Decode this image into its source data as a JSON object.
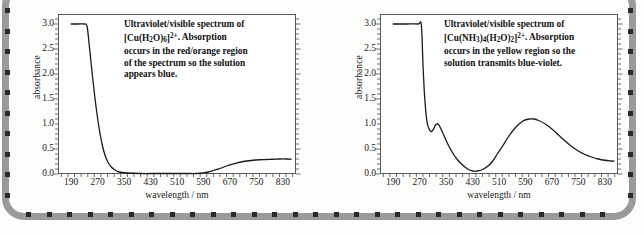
{
  "figure": {
    "background_color": "#fdfdfc",
    "border_color": "#9a9a9a",
    "dot_color": "#2a2a2a",
    "curve_color": "#1a1a1a"
  },
  "panels": [
    {
      "id": "cu-aqua",
      "annotation_plain": "Ultraviolet/visible spectrum of [Cu(H2O)6]2+. Absorption occurs in the red/orange region of the spectrum so the solution appears blue.",
      "annotation_parts": {
        "line1": "Ultraviolet/visible spectrum of",
        "formula_pre": "[Cu(H",
        "formula_sub1": "2",
        "formula_mid": "O)",
        "formula_sub2": "6",
        "formula_post": "]",
        "formula_sup": "2+",
        "after_formula": ". Absorption",
        "line3": "occurs in the red/orange region",
        "line4": "of the spectrum so the solution",
        "line5": "appears blue."
      }
    },
    {
      "id": "cu-ammine",
      "annotation_plain": "Ultraviolet/visible spectrum of [Cu(NH3)4(H2O)2]2+. Absorption occurs in the yellow region so the solution transmits blue-violet.",
      "annotation_parts": {
        "line1": "Ultraviolet/visible spectrum of",
        "formula_pre": "[Cu(NH",
        "formula_sub1": "3",
        "formula_mid": ")",
        "formula_sub2": "4",
        "formula_mid2": "(H",
        "formula_sub3": "2",
        "formula_mid3": "O)",
        "formula_sub4": "2",
        "formula_post": "]",
        "formula_sup": "2+",
        "after_formula": ". Absorption",
        "line3": "occurs in the yellow region so the",
        "line4": "solution transmits blue-violet."
      }
    }
  ],
  "chart_data": [
    {
      "type": "line",
      "title": "Ultraviolet/visible spectrum of [Cu(H2O)6]2+",
      "xlabel": "wavelength / nm",
      "ylabel": "absorbance",
      "xlim": [
        150,
        870
      ],
      "ylim": [
        0.0,
        3.2
      ],
      "xticks": [
        190,
        270,
        350,
        430,
        510,
        590,
        670,
        750,
        830
      ],
      "yticks": [
        "0.0",
        "0.5",
        "1.0",
        "1.5",
        "2.0",
        "2.5",
        "3.0"
      ],
      "ytick_values": [
        0.0,
        0.5,
        1.0,
        1.5,
        2.0,
        2.5,
        3.0
      ],
      "minor_tick_step": 20,
      "grid": false,
      "legend": "none",
      "series": [
        {
          "name": "absorbance",
          "x": [
            190,
            210,
            230,
            238,
            245,
            252,
            260,
            268,
            276,
            284,
            292,
            300,
            310,
            320,
            335,
            360,
            400,
            450,
            500,
            540,
            570,
            590,
            605,
            620,
            640,
            660,
            680,
            700,
            720,
            740,
            760,
            780,
            800,
            820,
            840,
            855
          ],
          "y": [
            3.0,
            3.0,
            3.0,
            2.95,
            2.55,
            2.1,
            1.62,
            1.2,
            0.85,
            0.58,
            0.38,
            0.25,
            0.15,
            0.09,
            0.04,
            0.02,
            0.01,
            0.01,
            0.01,
            0.01,
            0.01,
            0.02,
            0.04,
            0.07,
            0.11,
            0.16,
            0.2,
            0.235,
            0.26,
            0.275,
            0.285,
            0.29,
            0.295,
            0.3,
            0.3,
            0.295
          ]
        }
      ]
    },
    {
      "type": "line",
      "title": "Ultraviolet/visible spectrum of [Cu(NH3)4(H2O)2]2+",
      "xlabel": "wavelength / nm",
      "ylabel": "absorbance",
      "xlim": [
        150,
        870
      ],
      "ylim": [
        0.0,
        3.2
      ],
      "xticks": [
        190,
        270,
        350,
        430,
        510,
        590,
        670,
        750,
        830
      ],
      "yticks": [
        "0.0",
        "0.5",
        "1.0",
        "1.5",
        "2.0",
        "2.5",
        "3.0"
      ],
      "ytick_values": [
        0.0,
        0.5,
        1.0,
        1.5,
        2.0,
        2.5,
        3.0
      ],
      "minor_tick_step": 20,
      "grid": false,
      "legend": "none",
      "peaks": [
        {
          "wavelength": 322,
          "absorbance": 1.0,
          "label": "shoulder"
        },
        {
          "wavelength": 610,
          "absorbance": 1.1,
          "label": "d-d band"
        }
      ],
      "minimum": {
        "wavelength": 430,
        "absorbance": 0.05
      },
      "series": [
        {
          "name": "absorbance",
          "x": [
            190,
            230,
            265,
            275,
            280,
            285,
            292,
            300,
            306,
            312,
            318,
            324,
            330,
            340,
            355,
            370,
            385,
            400,
            415,
            430,
            445,
            460,
            475,
            490,
            505,
            520,
            540,
            560,
            580,
            600,
            615,
            630,
            650,
            670,
            690,
            710,
            730,
            750,
            770,
            790,
            810,
            830,
            850,
            858
          ],
          "y": [
            3.0,
            3.0,
            3.0,
            2.98,
            2.2,
            1.55,
            1.05,
            0.88,
            0.85,
            0.9,
            0.98,
            1.0,
            0.96,
            0.82,
            0.6,
            0.42,
            0.28,
            0.18,
            0.1,
            0.06,
            0.06,
            0.09,
            0.15,
            0.25,
            0.4,
            0.55,
            0.76,
            0.93,
            1.05,
            1.1,
            1.1,
            1.07,
            1.0,
            0.9,
            0.78,
            0.66,
            0.55,
            0.46,
            0.39,
            0.34,
            0.3,
            0.275,
            0.26,
            0.255
          ]
        }
      ]
    }
  ]
}
